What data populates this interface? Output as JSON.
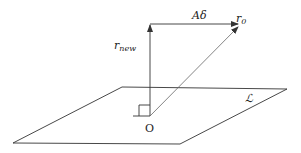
{
  "diagram": {
    "type": "vector-projection",
    "labels": {
      "a_delta": "Aδ",
      "r0_base": "r",
      "r0_sub": "0",
      "rnew_base": "r",
      "rnew_sub": "new",
      "plane": "ℒ",
      "origin": "O"
    },
    "colors": {
      "line": "#333333",
      "background": "#ffffff"
    }
  }
}
